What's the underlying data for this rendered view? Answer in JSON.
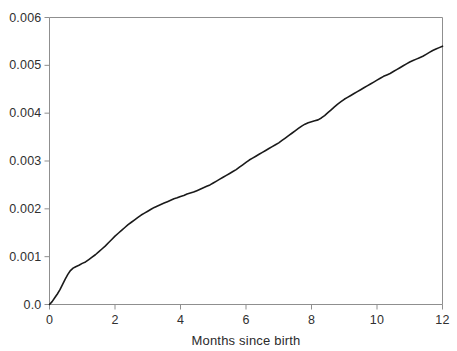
{
  "chart_data": {
    "type": "line",
    "title": "",
    "subtitle": "",
    "xlabel": "Months since birth",
    "ylabel": "",
    "xlim": [
      0,
      12
    ],
    "ylim": [
      0,
      0.006
    ],
    "xticks": [
      0,
      2,
      4,
      6,
      8,
      10,
      12
    ],
    "xticklabels": [
      "0",
      "2",
      "4",
      "6",
      "8",
      "10",
      "12"
    ],
    "yticks": [
      0.0,
      0.001,
      0.002,
      0.003,
      0.004,
      0.005,
      0.006
    ],
    "yticklabels": [
      "0.0",
      "0.001",
      "0.002",
      "0.003",
      "0.004",
      "0.005",
      "0.006"
    ],
    "grid": false,
    "legend": null,
    "annotations": [],
    "line_color": "#1a1a1a",
    "line_width": 1.6,
    "frame_color": "#8f8f8f",
    "series": [
      {
        "name": "cumulative hazard",
        "x": [
          0.0,
          0.08,
          0.16,
          0.24,
          0.32,
          0.4,
          0.48,
          0.56,
          0.64,
          0.72,
          0.8,
          0.9,
          1.0,
          1.1,
          1.2,
          1.3,
          1.4,
          1.5,
          1.6,
          1.7,
          1.8,
          1.9,
          2.0,
          2.1,
          2.2,
          2.3,
          2.4,
          2.5,
          2.6,
          2.7,
          2.8,
          2.9,
          3.0,
          3.1,
          3.2,
          3.3,
          3.4,
          3.5,
          3.6,
          3.7,
          3.8,
          3.9,
          4.0,
          4.1,
          4.2,
          4.3,
          4.4,
          4.5,
          4.6,
          4.7,
          4.8,
          4.9,
          5.0,
          5.1,
          5.2,
          5.3,
          5.4,
          5.5,
          5.6,
          5.7,
          5.8,
          5.9,
          6.0,
          6.1,
          6.2,
          6.3,
          6.4,
          6.5,
          6.6,
          6.7,
          6.8,
          6.9,
          7.0,
          7.1,
          7.2,
          7.3,
          7.4,
          7.5,
          7.6,
          7.7,
          7.8,
          7.9,
          8.0,
          8.1,
          8.2,
          8.3,
          8.4,
          8.5,
          8.6,
          8.7,
          8.8,
          8.9,
          9.0,
          9.1,
          9.2,
          9.3,
          9.4,
          9.5,
          9.6,
          9.7,
          9.8,
          9.9,
          10.0,
          10.1,
          10.2,
          10.3,
          10.4,
          10.5,
          10.6,
          10.7,
          10.8,
          10.9,
          11.0,
          11.1,
          11.2,
          11.3,
          11.4,
          11.5,
          11.6,
          11.7,
          11.8,
          11.9,
          12.0
        ],
        "y": [
          0.0,
          6e-05,
          0.00014,
          0.00022,
          0.00031,
          0.00042,
          0.00053,
          0.00063,
          0.00071,
          0.00076,
          0.00079,
          0.00082,
          0.00086,
          0.00089,
          0.00094,
          0.00099,
          0.00104,
          0.0011,
          0.00116,
          0.00122,
          0.00129,
          0.00136,
          0.00143,
          0.00149,
          0.00155,
          0.00161,
          0.00167,
          0.00172,
          0.00177,
          0.00182,
          0.00187,
          0.00191,
          0.00195,
          0.00199,
          0.00203,
          0.00206,
          0.00209,
          0.00212,
          0.00215,
          0.00218,
          0.00221,
          0.00223,
          0.00226,
          0.00228,
          0.00231,
          0.00233,
          0.00235,
          0.00238,
          0.00241,
          0.00244,
          0.00247,
          0.0025,
          0.00254,
          0.00258,
          0.00262,
          0.00266,
          0.0027,
          0.00274,
          0.00278,
          0.00282,
          0.00287,
          0.00292,
          0.00297,
          0.00302,
          0.00306,
          0.0031,
          0.00314,
          0.00318,
          0.00322,
          0.00326,
          0.0033,
          0.00334,
          0.00338,
          0.00343,
          0.00348,
          0.00353,
          0.00358,
          0.00363,
          0.00368,
          0.00373,
          0.00377,
          0.0038,
          0.00382,
          0.00384,
          0.00386,
          0.0039,
          0.00395,
          0.00401,
          0.00407,
          0.00413,
          0.00419,
          0.00424,
          0.00429,
          0.00433,
          0.00437,
          0.00441,
          0.00445,
          0.00449,
          0.00453,
          0.00457,
          0.00461,
          0.00465,
          0.00469,
          0.00473,
          0.00477,
          0.0048,
          0.00483,
          0.00487,
          0.00491,
          0.00495,
          0.00499,
          0.00503,
          0.00507,
          0.0051,
          0.00513,
          0.00516,
          0.00519,
          0.00523,
          0.00527,
          0.00531,
          0.00534,
          0.00537,
          0.0054
        ]
      }
    ]
  }
}
